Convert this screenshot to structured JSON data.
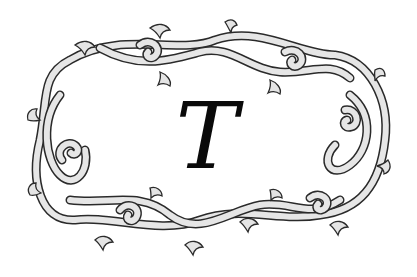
{
  "monogram": {
    "letter": "T"
  },
  "frame": {
    "style": "ornamental scrollwork",
    "fill_color": "#e4e4e4",
    "stroke_color": "#2a2a2a",
    "background_color": "#ffffff",
    "letter_color": "#0a0a0a"
  }
}
